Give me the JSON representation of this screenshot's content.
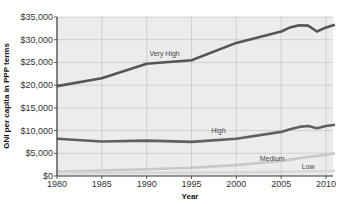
{
  "chart_data": {
    "type": "line",
    "title": "",
    "xlabel": "Year",
    "ylabel": "GNI per capita in PPP terms",
    "xlim": [
      1980,
      2011
    ],
    "ylim": [
      0,
      35000
    ],
    "grid": true,
    "x_ticks": [
      "1980",
      "1985",
      "1990",
      "1995",
      "2000",
      "2005",
      "2010"
    ],
    "y_ticks": [
      "$0",
      "$5,000",
      "$10,000",
      "$15,000",
      "$20,000",
      "$25,000",
      "$30,000",
      "$35,000"
    ],
    "x": [
      1980,
      1985,
      1990,
      1995,
      2000,
      2005,
      2006,
      2007,
      2008,
      2009,
      2010,
      2011
    ],
    "series": [
      {
        "name": "Very High",
        "color": "#555555",
        "values": [
          19800,
          21500,
          24700,
          25500,
          29300,
          31800,
          32700,
          33200,
          33100,
          31800,
          32700,
          33300
        ]
      },
      {
        "name": "High",
        "color": "#606060",
        "values": [
          8200,
          7600,
          7800,
          7500,
          8200,
          9700,
          10300,
          10800,
          11000,
          10500,
          11000,
          11300
        ]
      },
      {
        "name": "Medium",
        "color": "#c8c8c8",
        "values": [
          900,
          1200,
          1500,
          1800,
          2400,
          3300,
          3600,
          3900,
          4200,
          4400,
          4700,
          5000
        ]
      },
      {
        "name": "Low",
        "color": "#d8d8d8",
        "values": [
          600,
          650,
          700,
          750,
          800,
          900,
          950,
          1000,
          1050,
          1050,
          1100,
          1150
        ]
      }
    ],
    "annotations": [
      {
        "text": "Very High",
        "x": 1992,
        "y": 26500
      },
      {
        "text": "High",
        "x": 1998,
        "y": 9500
      },
      {
        "text": "Medium",
        "x": 2004,
        "y": 3200
      },
      {
        "text": "Low",
        "x": 2008,
        "y": 1500
      }
    ],
    "legend": "inline labels"
  }
}
